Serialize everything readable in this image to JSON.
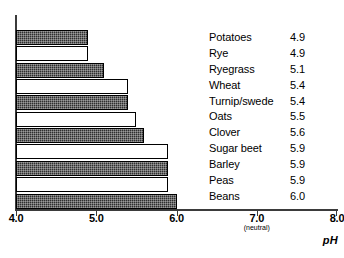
{
  "chart_data": {
    "type": "bar",
    "orientation": "horizontal",
    "title": "",
    "xlabel": "pH",
    "ylabel": "",
    "xlim": [
      4.0,
      8.0
    ],
    "grid": false,
    "legend": "right-table",
    "categories": [
      "Potatoes",
      "Rye",
      "Ryegrass",
      "Wheat",
      "Turnip/swede",
      "Oats",
      "Clover",
      "Sugar beet",
      "Barley",
      "Peas",
      "Beans"
    ],
    "values": [
      4.9,
      4.9,
      5.1,
      5.4,
      5.4,
      5.5,
      5.6,
      5.9,
      5.9,
      5.9,
      6.0
    ],
    "value_labels": [
      "4.9",
      "4.9",
      "5.1",
      "5.4",
      "5.4",
      "5.5",
      "5.6",
      "5.9",
      "5.9",
      "5.9",
      "6.0"
    ],
    "bar_fills": [
      "dark",
      "light",
      "dark",
      "light",
      "dark",
      "light",
      "dark",
      "light",
      "dark",
      "light",
      "dark"
    ],
    "xticks": [
      {
        "value": 4.0,
        "label": "4.0",
        "sublabel": ""
      },
      {
        "value": 5.0,
        "label": "5.0",
        "sublabel": ""
      },
      {
        "value": 6.0,
        "label": "6.0",
        "sublabel": ""
      },
      {
        "value": 7.0,
        "label": "7.0",
        "sublabel": "(neutral)"
      },
      {
        "value": 8.0,
        "label": "8.0",
        "sublabel": ""
      }
    ]
  },
  "colors": {
    "bar_dark": "#2f2f2f",
    "bar_light": "#ffffff",
    "axis": "#3b3b3b",
    "text": "#000000",
    "background": "#ffffff"
  }
}
